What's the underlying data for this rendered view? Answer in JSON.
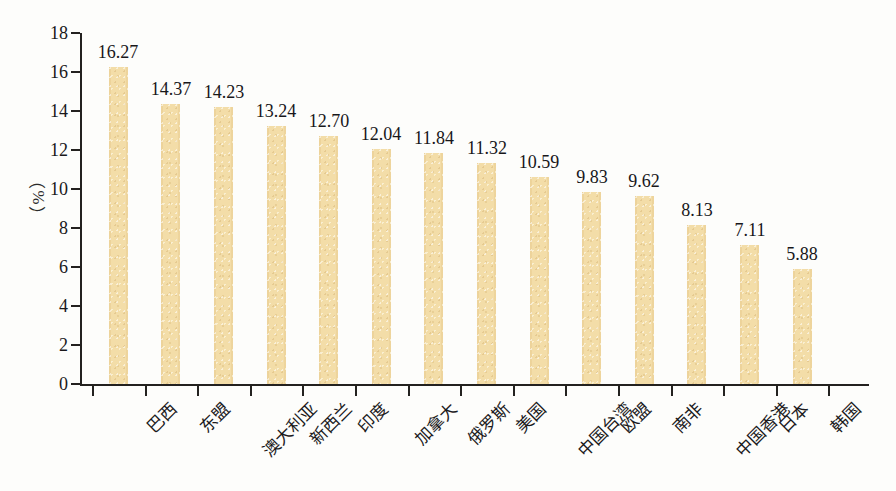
{
  "chart_data": {
    "type": "bar",
    "title": "",
    "subtitle": "",
    "xlabel": "",
    "ylabel": "（%）",
    "ylim": [
      0,
      18
    ],
    "ytick_step": 2,
    "yticks": [
      "0",
      "2",
      "4",
      "6",
      "8",
      "10",
      "12",
      "14",
      "16",
      "18"
    ],
    "grid": false,
    "legend": null,
    "bar_color": "#f3dda8",
    "axis_color": "#23211f",
    "text_color": "#19181a",
    "background_color": "#fdfdfb",
    "categories": [
      "巴西",
      "东盟",
      "澳大利亚",
      "新西兰",
      "印度",
      "加拿大",
      "俄罗斯",
      "美国",
      "中国台湾",
      "欧盟",
      "南非",
      "中国香港",
      "日本",
      "韩国"
    ],
    "values": [
      16.27,
      14.37,
      14.23,
      13.24,
      12.7,
      12.04,
      11.84,
      11.32,
      10.59,
      9.83,
      9.62,
      8.13,
      7.11,
      5.88
    ],
    "value_labels": [
      "16.27",
      "14.37",
      "14.23",
      "13.24",
      "12.70",
      "12.04",
      "11.84",
      "11.32",
      "10.59",
      "9.83",
      "9.62",
      "8.13",
      "7.11",
      "5.88"
    ]
  }
}
